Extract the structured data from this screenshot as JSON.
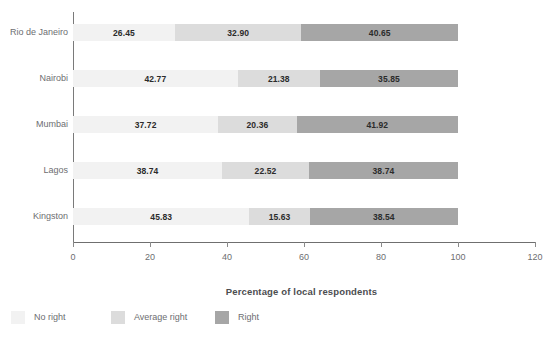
{
  "chart_data": {
    "type": "bar",
    "orientation": "horizontal",
    "stacked": true,
    "title": "",
    "subtitle": "",
    "xlabel": "Percentage of local respondents",
    "ylabel": "",
    "xlim": [
      0,
      120
    ],
    "xticks": [
      0,
      20,
      40,
      60,
      80,
      100,
      120
    ],
    "xtick_labels": [
      "0",
      "20",
      "40",
      "60",
      "80",
      "100",
      "120"
    ],
    "grid": false,
    "legend_position": "bottom-left",
    "categories": [
      "Rio de Janeiro",
      "Nairobi",
      "Mumbai",
      "Lagos",
      "Kingston"
    ],
    "series": [
      {
        "name": "No right",
        "color": "#f2f2f2",
        "values": [
          26.45,
          42.77,
          37.72,
          38.74,
          45.83
        ],
        "labels": [
          "26.45",
          "42.77",
          "37.72",
          "38.74",
          "45.83"
        ]
      },
      {
        "name": "Average right",
        "color": "#dcdcdc",
        "values": [
          32.9,
          21.38,
          20.36,
          22.52,
          15.63
        ],
        "labels": [
          "32.90",
          "21.38",
          "20.36",
          "22.52",
          "15.63"
        ]
      },
      {
        "name": "Right",
        "color": "#a6a6a6",
        "values": [
          40.65,
          35.85,
          41.92,
          38.74,
          38.54
        ],
        "labels": [
          "40.65",
          "35.85",
          "41.92",
          "38.74",
          "38.54"
        ]
      }
    ]
  },
  "legend": {
    "items": [
      {
        "label": "No right",
        "color": "#f2f2f2"
      },
      {
        "label": "Average right",
        "color": "#dcdcdc"
      },
      {
        "label": "Right",
        "color": "#a6a6a6"
      }
    ]
  },
  "axis": {
    "x_title": "Percentage of local respondents",
    "tick_labels": [
      "0",
      "20",
      "40",
      "60",
      "80",
      "100",
      "120"
    ]
  },
  "colors": {
    "axis_line": "#6f6f6f",
    "tick_text": "#6d6e71",
    "value_text": "#2b2b2b",
    "background": "#ffffff"
  }
}
